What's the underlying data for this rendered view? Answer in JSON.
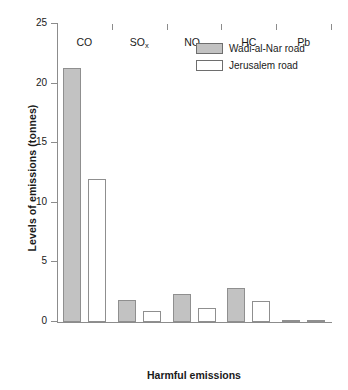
{
  "chart_data": {
    "type": "bar",
    "title": "",
    "xlabel": "Harmful emissions",
    "ylabel": "Levels of emissions (tonnes)",
    "categories": [
      "CO",
      "SOx",
      "NOx",
      "HC",
      "Pb"
    ],
    "category_labels_html": [
      "CO",
      "SO<sub>x</sub>",
      "NO<sub>x</sub>",
      "HC",
      "Pb"
    ],
    "series": [
      {
        "name": "Wadi-al-Nar road",
        "color": "#c2c2c2",
        "values": [
          21.3,
          1.85,
          2.35,
          2.85,
          0.1
        ]
      },
      {
        "name": "Jerusalem road",
        "color": "#ffffff",
        "values": [
          12.0,
          0.9,
          1.2,
          1.75,
          0.05
        ]
      }
    ],
    "ylim": [
      0,
      25
    ],
    "yticks": [
      0,
      5,
      10,
      15,
      20,
      25
    ],
    "ytick_labels": [
      "0",
      "5",
      "10",
      "15",
      "20",
      "25"
    ],
    "grid": false,
    "legend_position": "top-right"
  },
  "axes": {
    "y_title": "Levels of  emissions (tonnes)",
    "x_title": "Harmful emissions"
  },
  "legend": {
    "entries": [
      {
        "label": "Wadi-al-Nar road"
      },
      {
        "label": "Jerusalem road"
      }
    ]
  }
}
